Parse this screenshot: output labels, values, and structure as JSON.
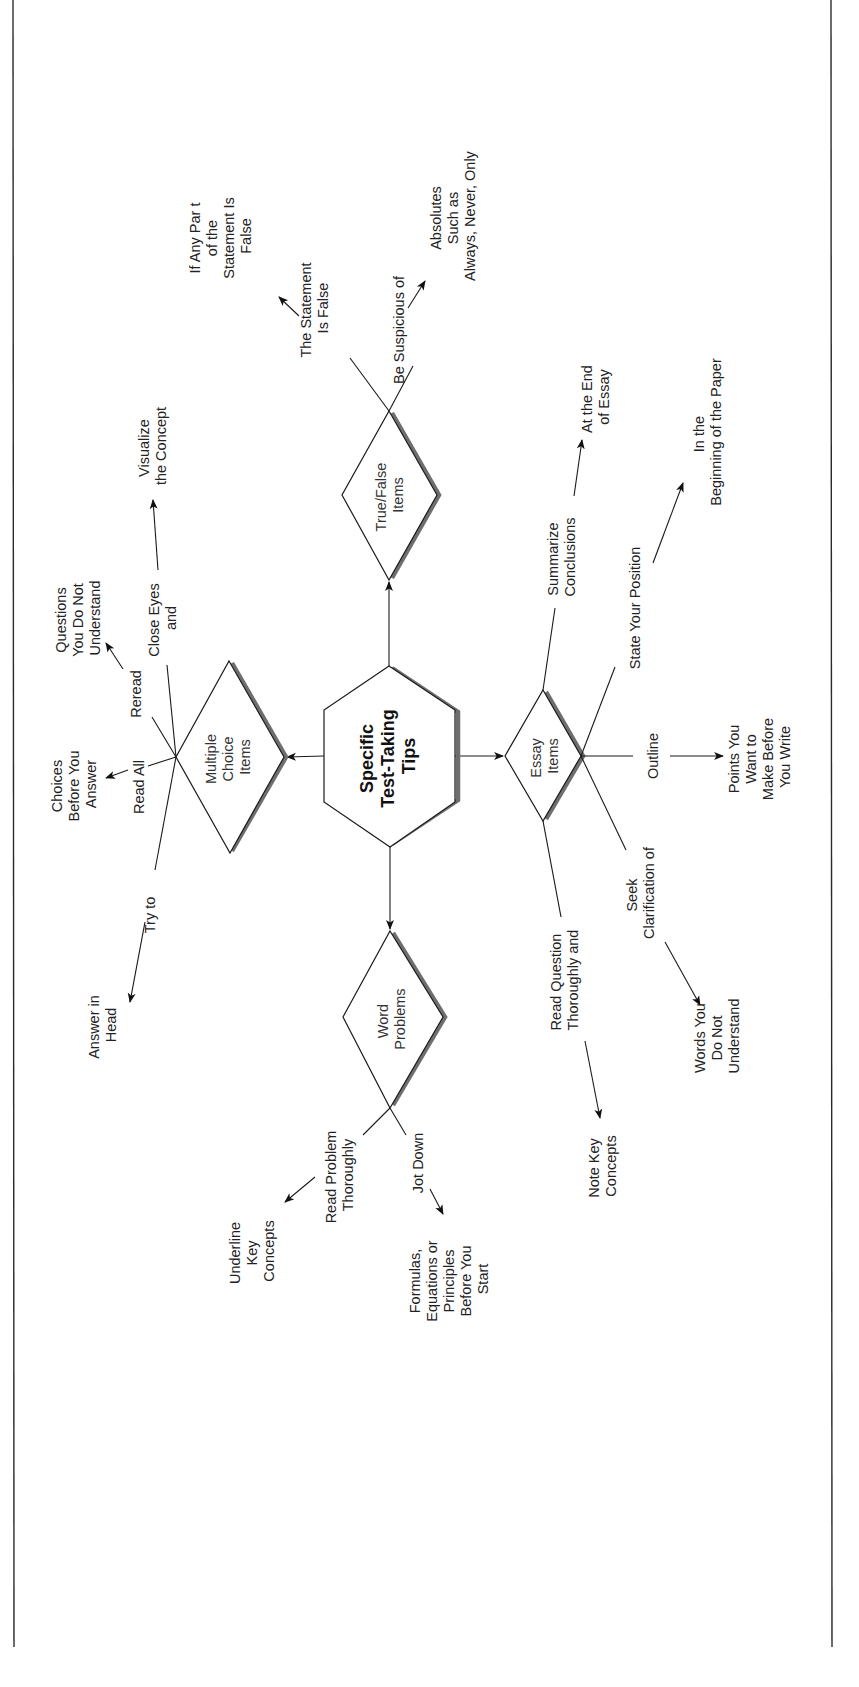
{
  "diagram": {
    "hub": {
      "lines": [
        "Specific",
        "Test-Taking",
        "Tips"
      ]
    },
    "nodes": {
      "multiple_choice": {
        "lines": [
          "Multiple",
          "Choice",
          "Items"
        ]
      },
      "true_false": {
        "lines": [
          "True/False",
          "Items"
        ]
      },
      "essay": {
        "lines": [
          "Essay",
          "Items"
        ]
      },
      "word_problems": {
        "lines": [
          "Word",
          "Problems"
        ]
      }
    },
    "branches": {
      "mc_try_to": "Try to",
      "mc_try_to_target": [
        "Answer in",
        "Head"
      ],
      "mc_read_all": "Read All",
      "mc_read_all_target": [
        "Choices",
        "Before You",
        "Answer"
      ],
      "mc_reread": "Reread",
      "mc_reread_target": [
        "Questions",
        "You Do Not",
        "Understand"
      ],
      "mc_close_eyes": [
        "Close Eyes",
        "and"
      ],
      "mc_close_eyes_target": [
        "Visualize",
        "the Concept"
      ],
      "tf_statement": [
        "The Statement",
        "Is False"
      ],
      "tf_statement_target": [
        "If Any Par t",
        "of the",
        "Statement Is",
        "False"
      ],
      "tf_suspicious": "Be Suspicious of",
      "tf_suspicious_target": [
        "Absolutes",
        "Such as",
        "Always, Never, Only"
      ],
      "essay_summarize": [
        "Summarize",
        "Conclusions"
      ],
      "essay_summarize_target": [
        "At the End",
        "of Essay"
      ],
      "essay_position": "State Your Position",
      "essay_position_target": [
        "In the",
        "Beginning of the Paper"
      ],
      "essay_outline": "Outline",
      "essay_outline_target": [
        "Points You",
        "Want to",
        "Make Before",
        "You Write"
      ],
      "essay_seek": [
        "Seek",
        "Clarification of"
      ],
      "essay_seek_target": [
        "Words You",
        "Do Not",
        "Understand"
      ],
      "essay_read_question": [
        "Read Question",
        "Thoroughly and"
      ],
      "essay_read_question_target": [
        "Note Key",
        "Concepts"
      ],
      "wp_read_problem": [
        "Read Problem",
        "Thoroughly"
      ],
      "wp_read_problem_target": [
        "Underline",
        "Key",
        "Concepts"
      ],
      "wp_jot_down": "Jot Down",
      "wp_jot_down_target": [
        "Formulas,",
        "Equations or",
        "Principles",
        "Before You",
        "Start"
      ]
    }
  },
  "colors": {
    "line": "#1a1a1a",
    "shadow": "#6e6e6e",
    "text": "#222222"
  }
}
